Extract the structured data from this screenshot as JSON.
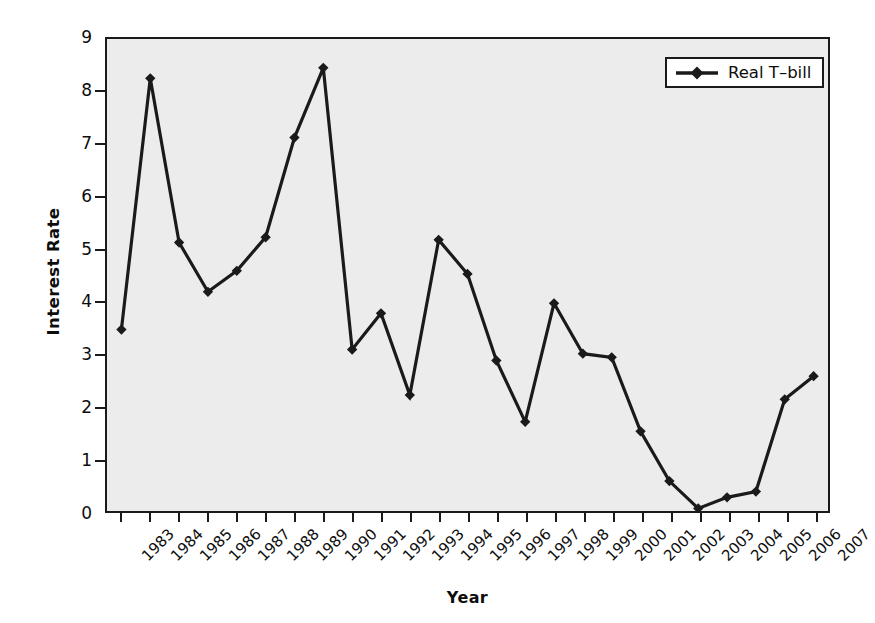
{
  "chart_data": {
    "type": "line",
    "title": "",
    "xlabel": "Year",
    "ylabel": "Interest Rate",
    "xlim": [
      1983,
      2007
    ],
    "ylim": [
      0,
      9
    ],
    "grid": false,
    "legend_position": "upper right",
    "x": [
      1983,
      1984,
      1985,
      1986,
      1987,
      1988,
      1989,
      1990,
      1991,
      1992,
      1993,
      1994,
      1995,
      1996,
      1997,
      1998,
      1999,
      2000,
      2001,
      2002,
      2003,
      2004,
      2005,
      2006,
      2007
    ],
    "xticklabels": [
      "1983",
      "1984",
      "1985",
      "1986",
      "1987",
      "1988",
      "1989",
      "1990",
      "1991",
      "1992",
      "1993",
      "1994",
      "1995",
      "1996",
      "1997",
      "1998",
      "1999",
      "2000",
      "2001",
      "2002",
      "2003",
      "2004",
      "2005",
      "2006",
      "2007"
    ],
    "yticks": [
      0,
      1,
      2,
      3,
      4,
      5,
      6,
      7,
      8,
      9
    ],
    "yticklabels": [
      "0",
      "1",
      "2",
      "3",
      "4",
      "5",
      "6",
      "7",
      "8",
      "9"
    ],
    "series": [
      {
        "name": "Real T-bill",
        "marker": "diamond",
        "color": "#1a1a1a",
        "values": [
          3.46,
          8.25,
          5.12,
          4.18,
          4.58,
          5.22,
          7.12,
          8.45,
          3.08,
          3.77,
          2.21,
          5.17,
          4.52,
          2.87,
          1.7,
          3.96,
          3.0,
          2.93,
          1.52,
          0.57,
          0.05,
          0.26,
          0.37,
          2.13,
          2.57
        ]
      }
    ]
  },
  "legend": {
    "entries": [
      {
        "label": "Real T–bill",
        "marker": "diamond-line-marker"
      }
    ]
  },
  "colors": {
    "plot_background": "#ececec",
    "page_background": "#ffffff",
    "axis": "#1a1a1a",
    "series": "#1a1a1a",
    "legend_background": "#ffffff"
  }
}
